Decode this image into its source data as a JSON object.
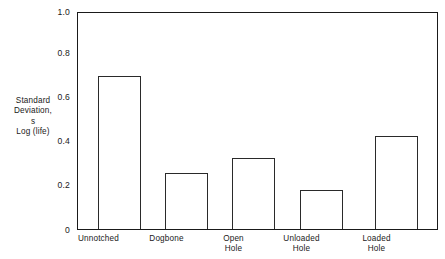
{
  "chart_data": {
    "type": "bar",
    "title": "",
    "subtitle": "",
    "categories": [
      "Unnotched",
      "Dogbone",
      "Open Hole",
      "Unloaded Hole",
      "Loaded Hole"
    ],
    "category_lines": [
      [
        "Unnotched"
      ],
      [
        "Dogbone"
      ],
      [
        "Open",
        "Hole"
      ],
      [
        "Unloaded",
        "Hole"
      ],
      [
        "Loaded",
        "Hole"
      ]
    ],
    "values": [
      0.71,
      0.26,
      0.33,
      0.18,
      0.43
    ],
    "xlabel": "",
    "ylabel": "Standard Deviation, s Log (life)",
    "ylabel_lines": [
      "Standard",
      "Deviation,",
      "s",
      "Log (life)"
    ],
    "ylim": [
      0,
      1.0
    ],
    "ytick_values": [
      0,
      0.2,
      0.4,
      0.6,
      0.8,
      1.0
    ],
    "ytick_labels": [
      "0",
      "0.2",
      "0.4",
      "0.6",
      "0.8",
      "1.0"
    ],
    "grid": false,
    "legend": false,
    "legend_position": "none",
    "bar_face_color": "#ffffff",
    "bar_edge_color": "#2a2a2a",
    "axis_color": "#1a1a1a",
    "background_color": "#ffffff"
  }
}
